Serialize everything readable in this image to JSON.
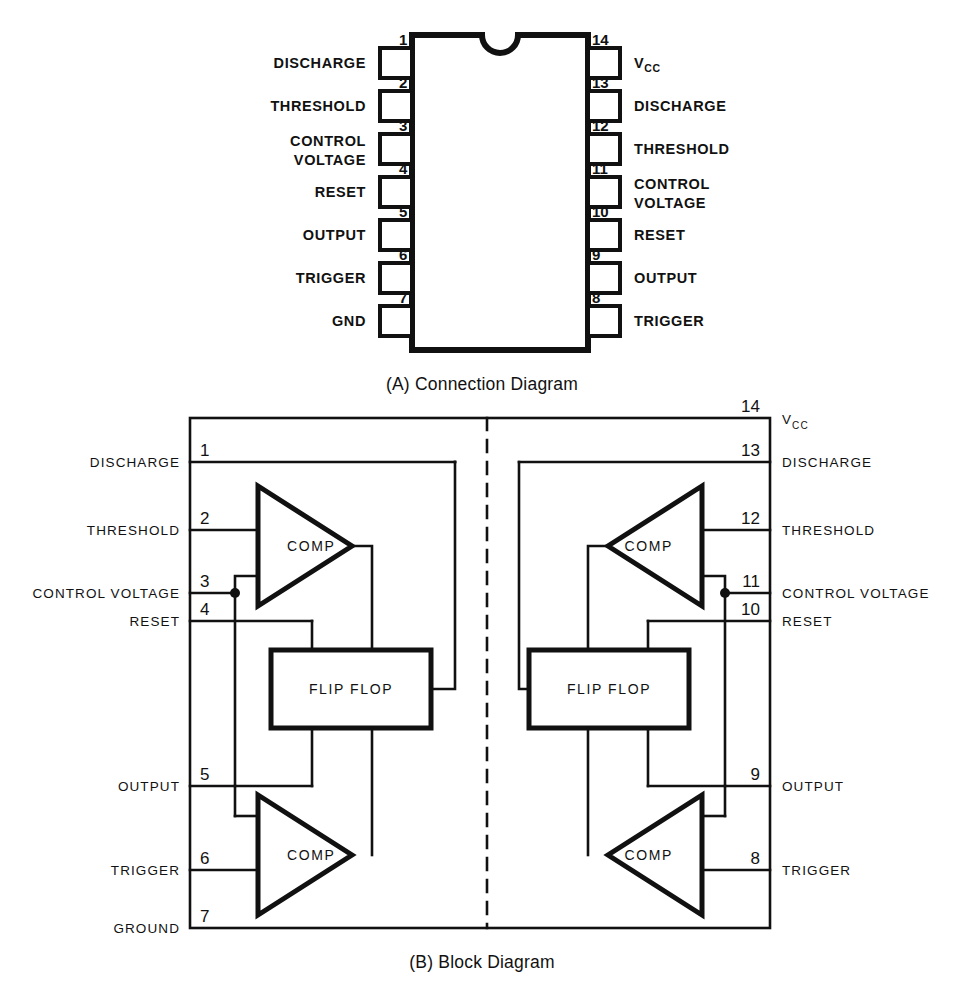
{
  "figure": {
    "title_a": "(A) Connection Diagram",
    "title_b": "(B) Block Diagram"
  },
  "connection_diagram": {
    "caption": "(A) Connection Diagram",
    "package": "14-pin DIP",
    "left_pins": [
      {
        "number": "1",
        "label": "DISCHARGE"
      },
      {
        "number": "2",
        "label": "THRESHOLD"
      },
      {
        "number": "3",
        "label": "CONTROL",
        "label2": "VOLTAGE"
      },
      {
        "number": "4",
        "label": "RESET"
      },
      {
        "number": "5",
        "label": "OUTPUT"
      },
      {
        "number": "6",
        "label": "TRIGGER"
      },
      {
        "number": "7",
        "label": "GND"
      }
    ],
    "right_pins": [
      {
        "number": "14",
        "label": "V",
        "sub": "CC"
      },
      {
        "number": "13",
        "label": "DISCHARGE"
      },
      {
        "number": "12",
        "label": "THRESHOLD"
      },
      {
        "number": "11",
        "label": "CONTROL",
        "label2": "VOLTAGE"
      },
      {
        "number": "10",
        "label": "RESET"
      },
      {
        "number": "9",
        "label": "OUTPUT"
      },
      {
        "number": "8",
        "label": "TRIGGER"
      }
    ]
  },
  "block_diagram": {
    "caption": "(B) Block Diagram",
    "left_pins": [
      {
        "number": "1",
        "label": "DISCHARGE"
      },
      {
        "number": "2",
        "label": "THRESHOLD"
      },
      {
        "number": "3",
        "label": "CONTROL VOLTAGE"
      },
      {
        "number": "4",
        "label": "RESET"
      },
      {
        "number": "5",
        "label": "OUTPUT"
      },
      {
        "number": "6",
        "label": "TRIGGER"
      },
      {
        "number": "7",
        "label": "GROUND"
      }
    ],
    "right_pins": [
      {
        "number": "14",
        "label": "V",
        "sub": "CC"
      },
      {
        "number": "13",
        "label": "DISCHARGE"
      },
      {
        "number": "12",
        "label": "THRESHOLD"
      },
      {
        "number": "11",
        "label": "CONTROL VOLTAGE"
      },
      {
        "number": "10",
        "label": "RESET"
      },
      {
        "number": "9",
        "label": "OUTPUT"
      },
      {
        "number": "8",
        "label": "TRIGGER"
      }
    ],
    "blocks": {
      "comparator_label": "COMP",
      "flipflop_label": "FLIP FLOP"
    },
    "left_half": {
      "comp_top": "COMP",
      "comp_bottom": "COMP",
      "flipflop": "FLIP FLOP"
    },
    "right_half": {
      "comp_top": "COMP",
      "comp_bottom": "COMP",
      "flipflop": "FLIP FLOP"
    }
  },
  "colors": {
    "ink": "#111111",
    "background": "#ffffff"
  }
}
